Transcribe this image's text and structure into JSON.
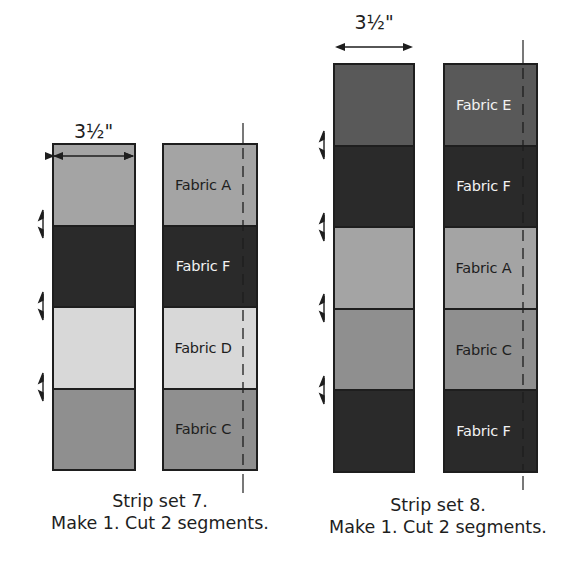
{
  "colors": {
    "A": "#a4a4a4",
    "C": "#8f8f8f",
    "D": "#d8d8d8",
    "E": "#595959",
    "F": "#2a2a2a",
    "outline": "#1e1e1e"
  },
  "strip_sets": [
    {
      "name": "Strip set 7",
      "dimension_label": "3½\"",
      "caption_line1": "Strip set 7.",
      "caption_line2": "Make 1. Cut 2 segments.",
      "segments": [
        {
          "fabric": "A",
          "label": "Fabric A"
        },
        {
          "fabric": "F",
          "label": "Fabric F"
        },
        {
          "fabric": "D",
          "label": "Fabric D"
        },
        {
          "fabric": "C",
          "label": "Fabric C"
        }
      ]
    },
    {
      "name": "Strip set 8",
      "dimension_label": "3½\"",
      "caption_line1": "Strip set 8.",
      "caption_line2": "Make 1. Cut 2 segments.",
      "segments": [
        {
          "fabric": "E",
          "label": "Fabric E"
        },
        {
          "fabric": "F",
          "label": "Fabric F"
        },
        {
          "fabric": "A",
          "label": "Fabric A"
        },
        {
          "fabric": "C",
          "label": "Fabric C"
        },
        {
          "fabric": "F",
          "label": "Fabric F"
        }
      ]
    }
  ]
}
